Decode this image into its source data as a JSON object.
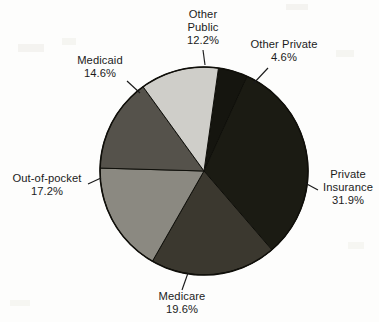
{
  "chart_data": {
    "type": "pie",
    "title": "",
    "subtitle": "",
    "xlabel": "",
    "ylabel": "",
    "legend_position": "none",
    "grid": false,
    "labels_show_percent": true,
    "total_percent": "100.1",
    "categories": [
      "Other Private",
      "Private Insurance",
      "Medicare",
      "Out-of-pocket",
      "Medicaid",
      "Other Public"
    ],
    "values": [
      4.6,
      31.9,
      19.6,
      17.2,
      14.6,
      12.2
    ],
    "value_labels": [
      "4.6%",
      "31.9%",
      "19.6%",
      "17.2%",
      "14.6%",
      "12.2%"
    ],
    "colors": [
      "#15150f",
      "#1b1b13",
      "#3b382f",
      "#8b8981",
      "#55524b",
      "#cfcec9"
    ],
    "slices": [
      {
        "label": "Other Private",
        "value": 4.6,
        "value_label": "4.6%",
        "color": "#15150f",
        "label_lines": [
          "Other Private",
          "4.6%"
        ],
        "label_align": "center"
      },
      {
        "label": "Private Insurance",
        "value": 31.9,
        "value_label": "31.9%",
        "color": "#1b1b13",
        "label_lines": [
          "Private",
          "Insurance",
          "31.9%"
        ],
        "label_align": "center"
      },
      {
        "label": "Medicare",
        "value": 19.6,
        "value_label": "19.6%",
        "color": "#3b382f",
        "label_lines": [
          "Medicare",
          "19.6%"
        ],
        "label_align": "center"
      },
      {
        "label": "Out-of-pocket",
        "value": 17.2,
        "value_label": "17.2%",
        "color": "#8b8981",
        "label_lines": [
          "Out-of-pocket",
          "17.2%"
        ],
        "label_align": "center"
      },
      {
        "label": "Medicaid",
        "value": 14.6,
        "value_label": "14.6%",
        "color": "#55524b",
        "label_lines": [
          "Medicaid",
          "14.6%"
        ],
        "label_align": "center"
      },
      {
        "label": "Other Public",
        "value": 12.2,
        "value_label": "12.2%",
        "color": "#cfcec9",
        "label_lines": [
          "Other",
          "Public",
          "12.2%"
        ],
        "label_align": "center"
      }
    ]
  },
  "labels": {
    "other_public": {
      "line1": "Other",
      "line2": "Public",
      "pct": "12.2%"
    },
    "other_private": {
      "line1": "Other Private",
      "pct": "4.6%"
    },
    "private_insurance": {
      "line1": "Private",
      "line2": "Insurance",
      "pct": "31.9%"
    },
    "medicare": {
      "line1": "Medicare",
      "pct": "19.6%"
    },
    "out_of_pocket": {
      "line1": "Out-of-pocket",
      "pct": "17.2%"
    },
    "medicaid": {
      "line1": "Medicaid",
      "pct": "14.6%"
    }
  },
  "style": {
    "outline_color": "#0f0f0a",
    "background": "#fdfdfc",
    "text_color": "#1b1b1b"
  }
}
